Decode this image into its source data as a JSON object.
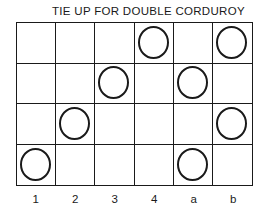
{
  "title": "TIE UP FOR DOUBLE CORDUROY",
  "columns": [
    "1",
    "2",
    "3",
    "4",
    "a",
    "b"
  ],
  "rows": [
    [
      0,
      0,
      0,
      1,
      0,
      1
    ],
    [
      0,
      0,
      1,
      0,
      1,
      0
    ],
    [
      0,
      1,
      0,
      0,
      0,
      1
    ],
    [
      1,
      0,
      0,
      0,
      1,
      0
    ]
  ],
  "mark_icon": "circle-outline"
}
